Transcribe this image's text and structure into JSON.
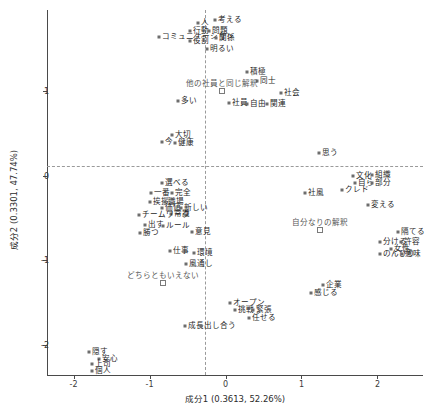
{
  "chart_data": {
    "type": "scatter",
    "title": "",
    "xlabel": "成分1 (0.3613, 52.26%)",
    "ylabel": "成分2 (0.3301, 47.74%)",
    "xlim": [
      -2.35,
      2.6
    ],
    "ylim": [
      -2.35,
      1.95
    ],
    "xticks": [
      "-2",
      "-1",
      "0",
      "1",
      "2"
    ],
    "xtickvals": [
      -2,
      -1,
      0,
      1,
      2
    ],
    "yticks": [
      "1",
      "0",
      "-1",
      "-2"
    ],
    "ytickvals": [
      1,
      0,
      -1,
      -2
    ],
    "grid": false,
    "zero_lines": true,
    "legend": "none",
    "points": [
      {
        "label": "人",
        "x": -0.36,
        "y": 1.8,
        "kind": "point"
      },
      {
        "label": "考える",
        "x": -0.14,
        "y": 1.83,
        "kind": "point"
      },
      {
        "label": "行動",
        "x": -0.47,
        "y": 1.7,
        "kind": "point"
      },
      {
        "label": "問題",
        "x": -0.22,
        "y": 1.7,
        "kind": "point"
      },
      {
        "label": "コミュニケーション",
        "x": -0.88,
        "y": 1.63,
        "kind": "point"
      },
      {
        "label": "関係",
        "x": -0.13,
        "y": 1.62,
        "kind": "point"
      },
      {
        "label": "役割",
        "x": -0.47,
        "y": 1.58,
        "kind": "point"
      },
      {
        "label": "明るい",
        "x": -0.25,
        "y": 1.49,
        "kind": "point"
      },
      {
        "label": "積極",
        "x": 0.28,
        "y": 1.22,
        "kind": "point"
      },
      {
        "label": "同士",
        "x": 0.42,
        "y": 1.11,
        "kind": "point"
      },
      {
        "label": "他の社員と同じ解釈",
        "x": -0.04,
        "y": 1.0,
        "kind": "square"
      },
      {
        "label": "社会",
        "x": 0.73,
        "y": 0.97,
        "kind": "point"
      },
      {
        "label": "多い",
        "x": -0.62,
        "y": 0.88,
        "kind": "point"
      },
      {
        "label": "社員",
        "x": 0.04,
        "y": 0.86,
        "kind": "point"
      },
      {
        "label": "自由",
        "x": 0.28,
        "y": 0.84,
        "kind": "point"
      },
      {
        "label": "関連",
        "x": 0.54,
        "y": 0.84,
        "kind": "point"
      },
      {
        "label": "大切",
        "x": -0.7,
        "y": 0.48,
        "kind": "point"
      },
      {
        "label": "今",
        "x": -0.83,
        "y": 0.4,
        "kind": "point"
      },
      {
        "label": "健康",
        "x": -0.67,
        "y": 0.38,
        "kind": "point"
      },
      {
        "label": "思う",
        "x": 1.23,
        "y": 0.27,
        "kind": "point"
      },
      {
        "label": "文化",
        "x": 1.68,
        "y": 0.0,
        "kind": "point"
      },
      {
        "label": "組織",
        "x": 1.93,
        "y": 0.01,
        "kind": "point"
      },
      {
        "label": "自ら",
        "x": 1.7,
        "y": -0.09,
        "kind": "point"
      },
      {
        "label": "部分",
        "x": 1.93,
        "y": -0.09,
        "kind": "point"
      },
      {
        "label": "選べる",
        "x": -0.84,
        "y": -0.09,
        "kind": "point"
      },
      {
        "label": "一番",
        "x": -0.98,
        "y": -0.2,
        "kind": "point"
      },
      {
        "label": "完全",
        "x": -0.71,
        "y": -0.2,
        "kind": "point"
      },
      {
        "label": "クレド",
        "x": 1.53,
        "y": -0.17,
        "kind": "point"
      },
      {
        "label": "社風",
        "x": 1.05,
        "y": -0.2,
        "kind": "point"
      },
      {
        "label": "挨拶",
        "x": -1.0,
        "y": -0.31,
        "kind": "point"
      },
      {
        "label": "職場",
        "x": -0.8,
        "y": -0.31,
        "kind": "point"
      },
      {
        "label": "価値",
        "x": -0.83,
        "y": -0.38,
        "kind": "point"
      },
      {
        "label": "新しい",
        "x": -0.58,
        "y": -0.38,
        "kind": "point"
      },
      {
        "label": "常識",
        "x": -0.72,
        "y": -0.45,
        "kind": "point"
      },
      {
        "label": "変える",
        "x": 1.88,
        "y": -0.35,
        "kind": "point"
      },
      {
        "label": "チームワーク",
        "x": -1.14,
        "y": -0.47,
        "kind": "point"
      },
      {
        "label": "出す",
        "x": -1.06,
        "y": -0.58,
        "kind": "point"
      },
      {
        "label": "ルール",
        "x": -0.82,
        "y": -0.59,
        "kind": "point"
      },
      {
        "label": "勝つ",
        "x": -1.12,
        "y": -0.68,
        "kind": "point"
      },
      {
        "label": "意見",
        "x": -0.44,
        "y": -0.66,
        "kind": "point"
      },
      {
        "label": "自分なりの解釈",
        "x": 1.25,
        "y": -0.64,
        "kind": "square"
      },
      {
        "label": "隔てる",
        "x": 2.27,
        "y": -0.66,
        "kind": "point"
      },
      {
        "label": "分ける",
        "x": 2.03,
        "y": -0.78,
        "kind": "point"
      },
      {
        "label": "許容",
        "x": 2.31,
        "y": -0.78,
        "kind": "point"
      },
      {
        "label": "女性",
        "x": 2.18,
        "y": -0.86,
        "kind": "point"
      },
      {
        "label": "仕事",
        "x": -0.73,
        "y": -0.89,
        "kind": "point"
      },
      {
        "label": "環境",
        "x": -0.42,
        "y": -0.91,
        "kind": "point"
      },
      {
        "label": "のんびり",
        "x": 2.03,
        "y": -0.93,
        "kind": "point"
      },
      {
        "label": "意味",
        "x": 2.32,
        "y": -0.93,
        "kind": "point"
      },
      {
        "label": "風通し",
        "x": -0.52,
        "y": -1.04,
        "kind": "point"
      },
      {
        "label": "どちらともいえない",
        "x": -0.82,
        "y": -1.27,
        "kind": "square"
      },
      {
        "label": "企業",
        "x": 1.28,
        "y": -1.29,
        "kind": "point"
      },
      {
        "label": "感じる",
        "x": 1.12,
        "y": -1.38,
        "kind": "point"
      },
      {
        "label": "オープン",
        "x": 0.06,
        "y": -1.5,
        "kind": "point"
      },
      {
        "label": "挑戦",
        "x": 0.13,
        "y": -1.59,
        "kind": "point"
      },
      {
        "label": "緊張",
        "x": 0.36,
        "y": -1.59,
        "kind": "point"
      },
      {
        "label": "任せる",
        "x": 0.31,
        "y": -1.68,
        "kind": "point"
      },
      {
        "label": "成長",
        "x": -0.53,
        "y": -1.77,
        "kind": "point"
      },
      {
        "label": "出し合う",
        "x": -0.32,
        "y": -1.77,
        "kind": "point"
      },
      {
        "label": "隠す",
        "x": -1.8,
        "y": -2.08,
        "kind": "point"
      },
      {
        "label": "安心",
        "x": -1.66,
        "y": -2.16,
        "kind": "point"
      },
      {
        "label": "上司",
        "x": -1.76,
        "y": -2.22,
        "kind": "point"
      },
      {
        "label": "個人",
        "x": -1.76,
        "y": -2.3,
        "kind": "point"
      }
    ]
  }
}
